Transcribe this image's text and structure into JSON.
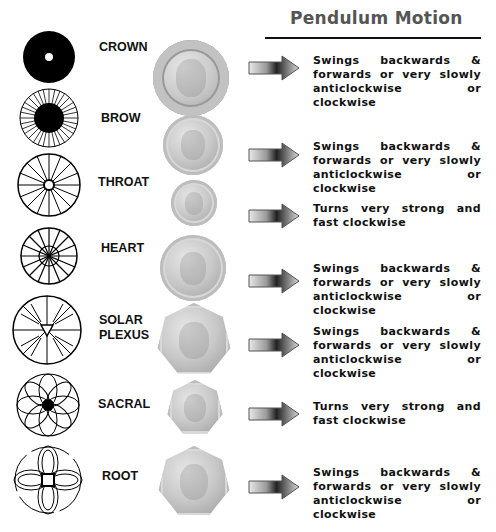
{
  "title": "Pendulum Motion",
  "rows": [
    {
      "chakra": "CROWN",
      "chakra_icon": "solid-ring-icon",
      "coin": "two-pound-coin",
      "motion": "Swings backwards & forwards or very slowly anticlockwise or clockwise"
    },
    {
      "chakra": "BROW",
      "chakra_icon": "radial-lines-icon",
      "coin": "one-pound-coin",
      "motion": "Swings backwards & forwards or very slowly anticlockwise or clockwise"
    },
    {
      "chakra": "THROAT",
      "chakra_icon": "spoked-wheel-icon",
      "coin": "five-pence-coin",
      "motion": "Turns very strong and fast clockwise"
    },
    {
      "chakra": "HEART",
      "chakra_icon": "wheel-of-spokes-icon",
      "coin": "ten-pence-coin",
      "motion": "Swings backwards & forwards or very slowly anticlockwise or clockwise"
    },
    {
      "chakra": "SOLAR PLEXUS",
      "chakra_icon": "triangle-rays-icon",
      "coin": "fifty-pence-coin",
      "motion": "Swings backwards & forwards or very slowly anticlockwise or clockwise"
    },
    {
      "chakra": "SACRAL",
      "chakra_icon": "flower-petals-icon",
      "coin": "twenty-pence-coin",
      "motion": "Turns very strong and fast clockwise"
    },
    {
      "chakra": "ROOT",
      "chakra_icon": "four-petal-square-icon",
      "coin": "fifty-pence-britannia-coin",
      "motion": "Swings backwards & forwards or very slowly anticlockwise or clockwise"
    }
  ]
}
